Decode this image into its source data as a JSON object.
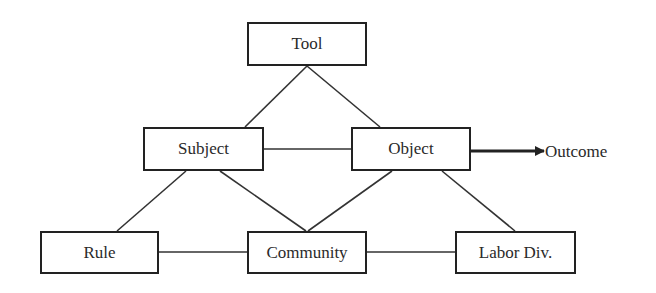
{
  "diagram": {
    "type": "activity-system-triangle",
    "colors": {
      "stroke": "#222222",
      "text": "#2a2a2a",
      "background": "#ffffff"
    },
    "nodes": {
      "tool": {
        "label": "Tool",
        "x": 247,
        "y": 22,
        "w": 120,
        "h": 44
      },
      "subject": {
        "label": "Subject",
        "x": 143,
        "y": 127,
        "w": 121,
        "h": 44
      },
      "object": {
        "label": "Object",
        "x": 351,
        "y": 127,
        "w": 120,
        "h": 44
      },
      "rule": {
        "label": "Rule",
        "x": 40,
        "y": 231,
        "w": 119,
        "h": 43
      },
      "community": {
        "label": "Community",
        "x": 247,
        "y": 231,
        "w": 120,
        "h": 43
      },
      "labor_div": {
        "label": "Labor Div.",
        "x": 455,
        "y": 231,
        "w": 121,
        "h": 43
      }
    },
    "outcome": {
      "label": "Outcome",
      "x": 545,
      "y": 142
    },
    "edges": [
      {
        "from": "tool",
        "to": "subject",
        "x1": 307,
        "y1": 66,
        "x2": 245,
        "y2": 127
      },
      {
        "from": "tool",
        "to": "object",
        "x1": 307,
        "y1": 66,
        "x2": 380,
        "y2": 127
      },
      {
        "from": "subject",
        "to": "object",
        "x1": 264,
        "y1": 149,
        "x2": 351,
        "y2": 149
      },
      {
        "from": "subject",
        "to": "rule",
        "x1": 186,
        "y1": 171,
        "x2": 117,
        "y2": 231
      },
      {
        "from": "subject",
        "to": "community",
        "x1": 220,
        "y1": 171,
        "x2": 306,
        "y2": 231
      },
      {
        "from": "object",
        "to": "community",
        "x1": 392,
        "y1": 171,
        "x2": 308,
        "y2": 231
      },
      {
        "from": "object",
        "to": "labor_div",
        "x1": 442,
        "y1": 171,
        "x2": 515,
        "y2": 231
      },
      {
        "from": "rule",
        "to": "community",
        "x1": 159,
        "y1": 252,
        "x2": 247,
        "y2": 252
      },
      {
        "from": "community",
        "to": "labor_div",
        "x1": 367,
        "y1": 252,
        "x2": 455,
        "y2": 252
      }
    ],
    "arrow": {
      "from": "object",
      "to": "outcome",
      "x1": 471,
      "y1": 151,
      "x2": 544,
      "y2": 151
    }
  }
}
